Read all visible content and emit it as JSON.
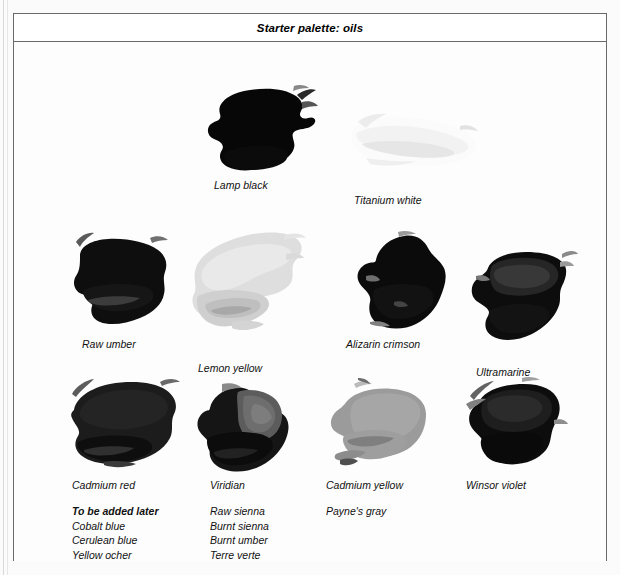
{
  "figure": {
    "title": "Starter palette: oils",
    "background_color": "#fdfdfd",
    "frame_color": "#6a6a6a"
  },
  "swatches": [
    {
      "name": "lamp-black",
      "label": "Lamp black",
      "row": 1,
      "column": 1,
      "swatch_tone": "#090909",
      "label_x": 200,
      "label_y": 137,
      "blob_x": 184,
      "blob_y": 42,
      "blob_w": 122,
      "blob_h": 92
    },
    {
      "name": "titanium-white",
      "label": "Titanium white",
      "row": 1,
      "column": 2,
      "swatch_tone": "#fafafa",
      "label_x": 340,
      "label_y": 152,
      "blob_x": 328,
      "blob_y": 62,
      "blob_w": 142,
      "blob_h": 82
    },
    {
      "name": "raw-umber",
      "label": "Raw umber",
      "row": 2,
      "column": 1,
      "swatch_tone": "#111111",
      "label_x": 68,
      "label_y": 296,
      "blob_x": 52,
      "blob_y": 188,
      "blob_w": 112,
      "blob_h": 104
    },
    {
      "name": "lemon-yellow",
      "label": "Lemon yellow",
      "row": 2,
      "column": 2,
      "swatch_tone": "#d8d8d8",
      "label_x": 184,
      "label_y": 320,
      "blob_x": 160,
      "blob_y": 182,
      "blob_w": 134,
      "blob_h": 124
    },
    {
      "name": "alizarin-crimson",
      "label": "Alizarin crimson",
      "row": 2,
      "column": 3,
      "swatch_tone": "#0d0d0d",
      "label_x": 332,
      "label_y": 296,
      "blob_x": 336,
      "blob_y": 188,
      "blob_w": 102,
      "blob_h": 106
    },
    {
      "name": "ultramarine",
      "label": "Ultramarine",
      "row": 2,
      "column": 4,
      "swatch_tone": "#131313",
      "label_x": 462,
      "label_y": 324,
      "blob_x": 448,
      "blob_y": 198,
      "blob_w": 116,
      "blob_h": 114
    },
    {
      "name": "cadmium-red",
      "label": "Cadmium red",
      "row": 3,
      "column": 1,
      "swatch_tone": "#1d1d1d",
      "label_x": 58,
      "label_y": 437,
      "blob_x": 50,
      "blob_y": 334,
      "blob_w": 122,
      "blob_h": 98
    },
    {
      "name": "viridian",
      "label": "Viridian",
      "row": 3,
      "column": 2,
      "swatch_tone": "#181818",
      "label_x": 196,
      "label_y": 437,
      "blob_x": 178,
      "blob_y": 340,
      "blob_w": 104,
      "blob_h": 94
    },
    {
      "name": "cadmium-yellow",
      "label": "Cadmium yellow",
      "row": 3,
      "column": 3,
      "swatch_tone": "#9a9a9a",
      "label_x": 312,
      "label_y": 437,
      "blob_x": 304,
      "blob_y": 336,
      "blob_w": 114,
      "blob_h": 96
    },
    {
      "name": "winsor-violet",
      "label": "Winsor violet",
      "row": 3,
      "column": 4,
      "swatch_tone": "#101010",
      "label_x": 452,
      "label_y": 437,
      "blob_x": 444,
      "blob_y": 334,
      "blob_w": 110,
      "blob_h": 98
    }
  ],
  "future_additions": {
    "heading": "To be added later",
    "column_1": [
      "Cobalt blue",
      "Cerulean blue",
      "Yellow ocher"
    ],
    "column_2": [
      "Raw sienna",
      "Burnt sienna",
      "Burnt umber",
      "Terre verte"
    ],
    "column_3": [
      "Payne's gray"
    ]
  }
}
